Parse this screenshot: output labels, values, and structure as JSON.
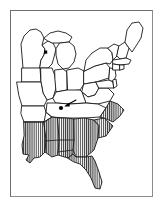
{
  "figure": {
    "title": "Distribution map of the eastern United States",
    "width": 163,
    "height": 207
  },
  "frame": {
    "name": "figure-border",
    "border_color": "#8c8c8c",
    "background_color": "#ffffff",
    "inset": 10
  },
  "style": {
    "outline_color": "#1a1a1a",
    "fill_color": "#ffffff",
    "hatch_color": "#1a1a1a",
    "hatch_background": "#ffffff",
    "hatch_orientation": "vertical",
    "hatch_spacing_px": 2,
    "marker_color": "#000000"
  },
  "legend": {
    "hatched_meaning": "shaded range",
    "dot_meaning": "locality record",
    "square_meaning": "locality record"
  },
  "map": {
    "region": "Eastern United States",
    "shaded_states": [
      "Louisiana",
      "Mississippi",
      "Alabama",
      "Georgia",
      "Florida",
      "South Carolina",
      "North Carolina"
    ],
    "unshaded_states": [
      "Minnesota",
      "Wisconsin",
      "Michigan",
      "Iowa",
      "Illinois",
      "Indiana",
      "Ohio",
      "Missouri",
      "Arkansas",
      "Kentucky",
      "Tennessee",
      "West Virginia",
      "Virginia",
      "Maryland",
      "Delaware",
      "Pennsylvania",
      "New Jersey",
      "New York",
      "Connecticut",
      "Rhode Island",
      "Massachusetts",
      "Vermont",
      "New Hampshire",
      "Maine"
    ]
  },
  "markers": [
    {
      "name": "tennessee-locality-dot",
      "shape": "circle",
      "state": "Tennessee",
      "x": 61,
      "y": 108,
      "radius": 2.1,
      "annotated_by": "arrow"
    },
    {
      "name": "wisconsin-locality-square",
      "shape": "square",
      "state": "Wisconsin",
      "x": 45.5,
      "y": 52,
      "size": 3.2
    }
  ],
  "annotations": [
    {
      "name": "tennessee-pointer-arrow",
      "type": "arrow",
      "from_x": 76,
      "from_y": 100,
      "to_x": 64.5,
      "to_y": 106,
      "points_to": "tennessee-locality-dot"
    }
  ]
}
